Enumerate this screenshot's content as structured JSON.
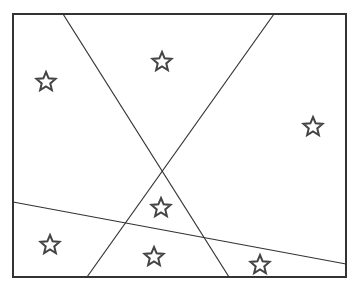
{
  "diagram": {
    "width": 356,
    "height": 288,
    "background": "#ffffff",
    "stroke_color": "#333333",
    "star_color": "#444444",
    "frame": {
      "x": 13,
      "y": 14,
      "width": 333,
      "height": 263
    },
    "lines": [
      {
        "id": "line-1",
        "x1": 63,
        "y1": 14,
        "x2": 229,
        "y2": 277
      },
      {
        "id": "line-2",
        "x1": 274,
        "y1": 14,
        "x2": 87,
        "y2": 277
      },
      {
        "id": "line-3",
        "x1": 13,
        "y1": 202,
        "x2": 346,
        "y2": 264
      }
    ],
    "stars": [
      {
        "id": "star-1",
        "cx": 46,
        "cy": 82
      },
      {
        "id": "star-2",
        "cx": 162,
        "cy": 62
      },
      {
        "id": "star-3",
        "cx": 313,
        "cy": 127
      },
      {
        "id": "star-4",
        "cx": 161,
        "cy": 208
      },
      {
        "id": "star-5",
        "cx": 50,
        "cy": 245
      },
      {
        "id": "star-6",
        "cx": 154,
        "cy": 257
      },
      {
        "id": "star-7",
        "cx": 260,
        "cy": 265
      }
    ],
    "star_radius": 10
  }
}
